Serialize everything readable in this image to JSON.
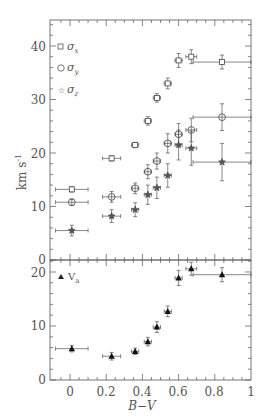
{
  "chart_data": [
    {
      "type": "scatter",
      "title": "",
      "xlabel": "B−V",
      "ylabel": "km s⁻¹",
      "xlim": [
        -0.1,
        1.0
      ],
      "ylim": [
        0,
        45
      ],
      "yticks": [
        10,
        20,
        30,
        40
      ],
      "legend_position": "upper-left",
      "series": [
        {
          "name": "σx",
          "marker": "square",
          "x": [
            0.01,
            0.23,
            0.36,
            0.43,
            0.48,
            0.54,
            0.6,
            0.67,
            0.84
          ],
          "y": [
            13.2,
            19.0,
            21.5,
            26.0,
            30.3,
            33.0,
            37.3,
            38.0,
            37.0
          ],
          "xerr": [
            0.09,
            0.05,
            0.02,
            0.02,
            0.02,
            0.02,
            0.02,
            0.03,
            0.16
          ],
          "yerr": [
            0.5,
            0.5,
            0.5,
            0.8,
            0.8,
            1.0,
            1.3,
            1.3,
            1.3
          ]
        },
        {
          "name": "σy",
          "marker": "circle",
          "x": [
            0.01,
            0.23,
            0.36,
            0.43,
            0.48,
            0.54,
            0.6,
            0.67,
            0.84
          ],
          "y": [
            10.8,
            11.8,
            13.4,
            16.5,
            18.5,
            21.8,
            23.5,
            24.3,
            26.7
          ],
          "xerr": [
            0.09,
            0.05,
            0.02,
            0.02,
            0.02,
            0.02,
            0.02,
            0.03,
            0.16
          ],
          "yerr": [
            0.6,
            1.0,
            1.0,
            1.3,
            1.5,
            1.8,
            2.0,
            2.2,
            2.5
          ]
        },
        {
          "name": "σz",
          "marker": "star",
          "x": [
            0.01,
            0.23,
            0.36,
            0.43,
            0.48,
            0.54,
            0.6,
            0.67,
            0.84
          ],
          "y": [
            5.5,
            8.2,
            9.4,
            12.2,
            13.5,
            15.8,
            21.5,
            20.9,
            18.3
          ],
          "xerr": [
            0.09,
            0.05,
            0.02,
            0.02,
            0.02,
            0.02,
            0.02,
            0.03,
            0.16
          ],
          "yerr": [
            1.0,
            1.2,
            1.3,
            1.8,
            2.0,
            2.2,
            2.8,
            3.2,
            3.5
          ]
        }
      ]
    },
    {
      "type": "scatter",
      "title": "",
      "xlabel": "B−V",
      "ylabel": "",
      "xlim": [
        -0.1,
        1.0
      ],
      "ylim": [
        0,
        22
      ],
      "xticks": [
        0,
        0.2,
        0.4,
        0.6,
        0.8,
        1
      ],
      "yticks": [
        0,
        10,
        20
      ],
      "legend_position": "upper-left",
      "series": [
        {
          "name": "Va",
          "marker": "triangle-filled",
          "x": [
            0.01,
            0.23,
            0.36,
            0.43,
            0.48,
            0.54,
            0.6,
            0.67,
            0.84
          ],
          "y": [
            5.8,
            4.4,
            5.3,
            7.1,
            9.8,
            12.7,
            18.9,
            20.6,
            19.5
          ],
          "xerr": [
            0.09,
            0.05,
            0.02,
            0.02,
            0.02,
            0.02,
            0.02,
            0.03,
            0.16
          ],
          "yerr": [
            0.6,
            0.7,
            0.6,
            0.8,
            1.0,
            1.0,
            1.4,
            1.2,
            1.3
          ]
        }
      ]
    }
  ],
  "labels": {
    "y_axis": "km s",
    "y_axis_sup": "-1",
    "x_axis": "B−V",
    "legend_sx": "σ",
    "legend_sx_sub": "x",
    "legend_sy": "σ",
    "legend_sy_sub": "y",
    "legend_sz": "σ",
    "legend_sz_sub": "z",
    "legend_va": "V",
    "legend_va_sub": "a"
  },
  "ticks": {
    "upper_y": [
      "10",
      "20",
      "30",
      "40"
    ],
    "lower_y": [
      "0",
      "10",
      "20"
    ],
    "x": [
      "0",
      "0.2",
      "0.4",
      "0.6",
      "0.8",
      "1"
    ],
    "upper_zero": "0"
  }
}
